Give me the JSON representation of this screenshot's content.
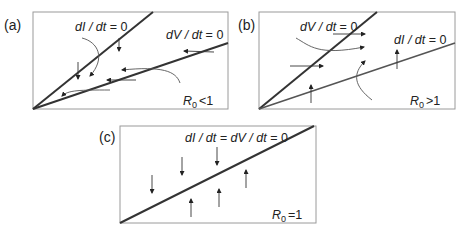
{
  "figure": {
    "panels": [
      {
        "id": "a",
        "label": "(a)",
        "condition": {
          "symbol": "R",
          "subscript": "0",
          "relation": "<1"
        },
        "nullclines": [
          {
            "name": "dI/dt=0",
            "text_italic": "dI / dt",
            "text_eq": " = 0",
            "slope": "steep"
          },
          {
            "name": "dV/dt=0",
            "text_italic": "dV / dt",
            "text_eq": " = 0",
            "slope": "shallow"
          }
        ],
        "flow_description": "Trajectories flow toward origin; arrows point down and left between nullclines"
      },
      {
        "id": "b",
        "label": "(b)",
        "condition": {
          "symbol": "R",
          "subscript": "0",
          "relation": ">1"
        },
        "nullclines": [
          {
            "name": "dV/dt=0",
            "text_italic": "dV / dt",
            "text_eq": " = 0",
            "slope": "steep"
          },
          {
            "name": "dI/dt=0",
            "text_italic": "dI / dt",
            "text_eq": " = 0",
            "slope": "shallow"
          }
        ],
        "flow_description": "Trajectories flow away from origin; arrows point right and up"
      },
      {
        "id": "c",
        "label": "(c)",
        "condition": {
          "symbol": "R",
          "subscript": "0",
          "relation": "=1"
        },
        "nullclines": [
          {
            "name": "dI/dt=dV/dt=0",
            "text_italic": "dI / dt = dV / dt",
            "text_eq": " = 0",
            "slope": "single"
          }
        ],
        "flow_description": "Single coincident nullcline; arrows above point down, arrows below point up"
      }
    ]
  }
}
